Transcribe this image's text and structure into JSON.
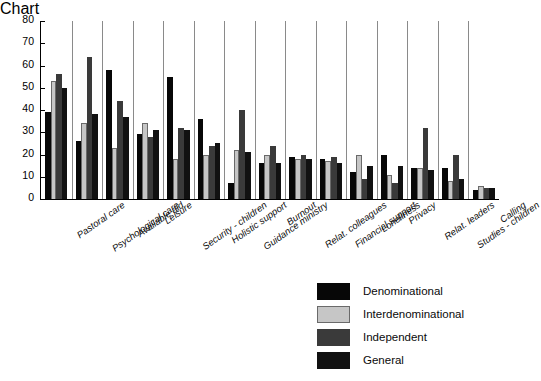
{
  "chart_data": {
    "type": "bar",
    "title": "",
    "subtitle": "",
    "xlabel": "",
    "ylabel": "",
    "ylim": [
      0,
      80
    ],
    "yticks": [
      0,
      10,
      20,
      30,
      40,
      50,
      60,
      70,
      80
    ],
    "grid": false,
    "group_separators": true,
    "legend_position": "lower-right",
    "categories": [
      "Pastoral care",
      "Psychological care",
      "Available aid",
      "Leisure",
      "Security - children",
      "Holistic support",
      "Guidance ministry",
      "Burnout",
      "Relat. colleagues",
      "Financial support",
      "Loneliness",
      "Privacy",
      "Relat. leaders",
      "Studies - children",
      "Calling"
    ],
    "series": [
      {
        "name": "Denominational",
        "color": "#070707",
        "values": [
          39,
          26,
          58,
          29,
          55,
          36,
          7,
          16,
          19,
          18,
          12,
          20,
          14,
          14,
          4
        ]
      },
      {
        "name": "Interdenominational",
        "color": "#c6c6c6",
        "values": [
          53,
          34,
          23,
          34,
          18,
          20,
          22,
          20,
          18,
          17,
          20,
          11,
          14,
          8,
          6
        ]
      },
      {
        "name": "Independent",
        "color": "#3a3a3a",
        "values": [
          56,
          64,
          44,
          28,
          32,
          24,
          40,
          24,
          20,
          19,
          9,
          7,
          32,
          20,
          5
        ]
      },
      {
        "name": "General",
        "color": "#111111",
        "values": [
          50,
          38,
          37,
          31,
          31,
          25,
          21,
          16,
          18,
          16,
          15,
          15,
          13,
          9,
          5
        ]
      }
    ]
  },
  "legend": {
    "entries": [
      {
        "label": "Denominational"
      },
      {
        "label": "Interdenominational"
      },
      {
        "label": "Independent"
      },
      {
        "label": "General"
      }
    ]
  }
}
